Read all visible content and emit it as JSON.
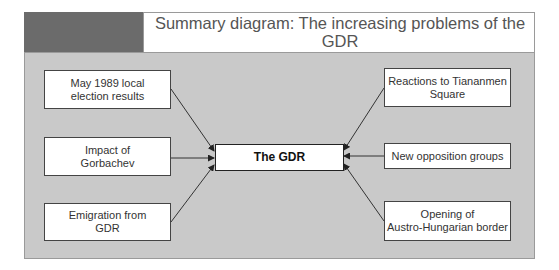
{
  "header": {
    "title_line1": "Summary diagram: The increasing problems of the GDR",
    "title_line2": "in the summer of 1989"
  },
  "diagram": {
    "center": {
      "label": "The GDR"
    },
    "left_nodes": [
      {
        "line1": "May 1989 local",
        "line2": "election results"
      },
      {
        "line1": "Impact of",
        "line2": "Gorbachev"
      },
      {
        "line1": "Emigration from",
        "line2": "GDR"
      }
    ],
    "right_nodes": [
      {
        "line1": "Reactions to Tiananmen",
        "line2": "Square"
      },
      {
        "line1": "New opposition groups",
        "line2": ""
      },
      {
        "line1": "Opening of",
        "line2": "Austro-Hungarian border"
      }
    ]
  },
  "colors": {
    "dark_block": "#6b6b6b",
    "panel": "#c9c9c9",
    "node_fill": "#ffffff",
    "arrow": "#333333"
  }
}
